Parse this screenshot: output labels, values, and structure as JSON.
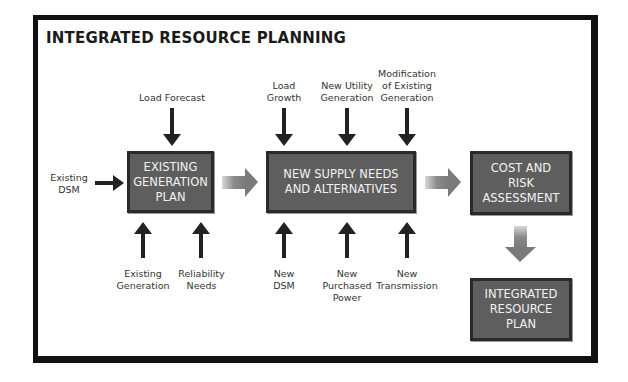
{
  "title": "INTEGRATED RESOURCE PLANNING",
  "colors": {
    "box_fill": "#5e5e5e",
    "box_border": "#2a2a2a",
    "box_text": "#f2f2f2",
    "frame": "#111111",
    "flow_arrow": "#8a8a8a",
    "input_arrow": "#222222"
  },
  "boxes": {
    "existing_plan": "EXISTING\nGENERATION\nPLAN",
    "new_supply": "NEW SUPPLY NEEDS\nAND ALTERNATIVES",
    "cost_risk": "COST AND\nRISK\nASSESSMENT",
    "irp": "INTEGRATED\nRESOURCE\nPLAN"
  },
  "inputs_top": {
    "load_forecast": "Load Forecast",
    "load_growth": "Load\nGrowth",
    "new_utility_generation": "New Utility\nGeneration",
    "modification_existing": "Modification\nof Existing\nGeneration"
  },
  "inputs_left": {
    "existing_dsm": "Existing\nDSM"
  },
  "inputs_bottom": {
    "existing_generation": "Existing\nGeneration",
    "reliability_needs": "Reliability\nNeeds",
    "new_dsm": "New\nDSM",
    "new_purchased_power": "New\nPurchased\nPower",
    "new_transmission": "New\nTransmission"
  }
}
